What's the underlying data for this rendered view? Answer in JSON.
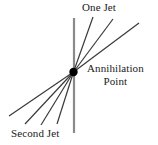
{
  "figure": {
    "background_color": "#ffffff"
  },
  "labels": {
    "one_jet": "One Jet",
    "annihilation_line1": "Annihilation",
    "annihilation_line2": "Point",
    "second_jet": "Second Jet"
  },
  "colors": {
    "ray": "#3a3a3a",
    "axis": "#8a8a8a",
    "vertex": "#000000",
    "text": "#1a1a1a"
  },
  "geometry": {
    "vertex": {
      "x": 73.5,
      "y": 72,
      "radius": 4.2
    },
    "axis_line": {
      "x1": 74,
      "y1": 18,
      "x2": 74,
      "y2": 133,
      "width": 2.2
    },
    "upper_rays": [
      {
        "name": "one-jet-ray-1",
        "x1": 73.5,
        "y1": 72,
        "x2": 93,
        "y2": 17
      },
      {
        "name": "one-jet-ray-2",
        "x1": 73.5,
        "y1": 72,
        "x2": 113,
        "y2": 19
      },
      {
        "name": "one-jet-ray-3",
        "x1": 73.5,
        "y1": 72,
        "x2": 139,
        "y2": 23
      }
    ],
    "lower_rays": [
      {
        "name": "second-jet-ray-1",
        "x1": 73.5,
        "y1": 72,
        "x2": 9,
        "y2": 116
      },
      {
        "name": "second-jet-ray-2",
        "x1": 73.5,
        "y1": 72,
        "x2": 25,
        "y2": 124
      },
      {
        "name": "second-jet-ray-3",
        "x1": 73.5,
        "y1": 72,
        "x2": 41,
        "y2": 125
      },
      {
        "name": "second-jet-ray-4",
        "x1": 73.5,
        "y1": 72,
        "x2": 57,
        "y2": 124
      }
    ]
  }
}
